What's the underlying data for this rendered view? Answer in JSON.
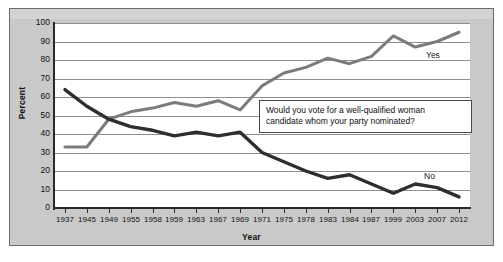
{
  "chart_data": {
    "type": "line",
    "title": "",
    "xlabel": "Year",
    "ylabel": "Percent",
    "ylim": [
      0,
      100
    ],
    "ytick_step": 10,
    "yticks": [
      100,
      90,
      80,
      70,
      60,
      50,
      40,
      30,
      20,
      10,
      0
    ],
    "grid": true,
    "legend": "inline-labels",
    "annotation": {
      "line1": "Would you vote for a well-qualified woman",
      "line2": "candidate whom your party nominated?"
    },
    "categories": [
      "1937",
      "1945",
      "1949",
      "1955",
      "1958",
      "1959",
      "1963",
      "1967",
      "1969",
      "1971",
      "1975",
      "1978",
      "1983",
      "1984",
      "1987",
      "1999",
      "2003",
      "2007",
      "2012"
    ],
    "series": [
      {
        "name": "Yes",
        "color": "#7b7b7b",
        "values": [
          33,
          33,
          48,
          52,
          54,
          57,
          55,
          58,
          53,
          66,
          73,
          76,
          81,
          78,
          82,
          93,
          87,
          90,
          95
        ]
      },
      {
        "name": "No",
        "color": "#2e2e2e",
        "values": [
          64,
          55,
          48,
          44,
          42,
          39,
          41,
          39,
          41,
          30,
          25,
          20,
          16,
          18,
          13,
          8,
          13,
          11,
          6
        ]
      }
    ]
  },
  "colors": {
    "panel_background": "#c9c9c9",
    "plot_background": "#ffffff",
    "gridline": "#8f8f8f",
    "axis": "#2b2b2b",
    "yes_series": "#7b7b7b",
    "no_series": "#2e2e2e"
  }
}
